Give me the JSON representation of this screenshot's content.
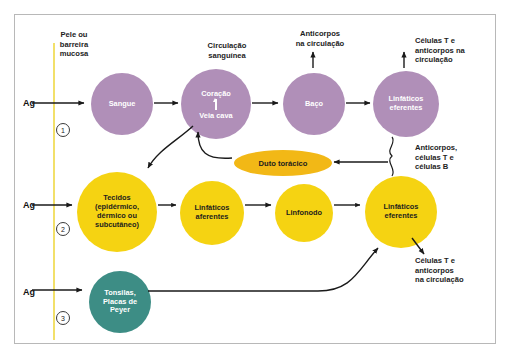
{
  "figure": {
    "barrier_label": "Pele ou\nbarreira\nmucosa",
    "antigen_label": "Ag",
    "pathways": [
      {
        "number": "1"
      },
      {
        "number": "2"
      },
      {
        "number": "3"
      }
    ]
  },
  "nodes": {
    "sangue": {
      "label": "Sangue",
      "color": "#b08fb8"
    },
    "heart": {
      "top_label": "Coração",
      "bottom_label": "Veia cava",
      "color": "#b08fb8"
    },
    "baco": {
      "label": "Baço",
      "color": "#b08fb8"
    },
    "linfaticos_eferentes_top": {
      "label": "Linfáticos\neferentes",
      "color": "#b08fb8"
    },
    "duto_toracico": {
      "label": "Duto torácico",
      "color": "#f2b816"
    },
    "tecidos": {
      "label": "Tecidos\n(epidérmico,\ndérmico ou\nsubcutâneo)",
      "color": "#f5d312"
    },
    "linfaticos_aferentes": {
      "label": "Linfáticos\naferentes",
      "color": "#f5d312"
    },
    "linfonodo": {
      "label": "Linfonodo",
      "color": "#f5d312"
    },
    "linfaticos_eferentes_bottom": {
      "label": "Linfáticos\neferentes",
      "color": "#f5d312"
    },
    "tonsilas": {
      "label": "Tonsilas,\nPlacas de\nPeyer",
      "color": "#3d8d85"
    }
  },
  "annotations": {
    "circulacao_sanguinea": "Circulação\nsanguínea",
    "anticorpos_circulacao": "Anticorpos\nna circulação",
    "celulas_t_anticorpos_top": "Células T e\nanticorpos na\ncirculação",
    "anticorpos_celulas_tb": "Anticorpos,\ncélulas T e\ncélulas B",
    "celulas_t_anticorpos_bottom": "Células T e\nanticorpos\nna circulação"
  },
  "colors": {
    "purple": "#b08fb8",
    "yellow": "#f5d312",
    "orange": "#f2b816",
    "teal": "#3d8d85",
    "barrier_line": "#f2e06a",
    "frame_border": "#b8b8b8",
    "arrow": "#1a1a1a"
  }
}
